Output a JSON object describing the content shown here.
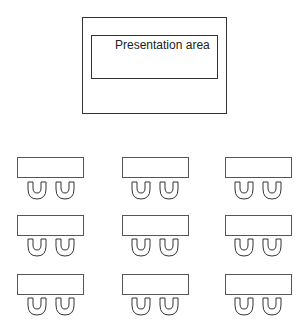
{
  "diagram": {
    "type": "classroom-seating-layout",
    "presentation": {
      "label": "Presentation area"
    },
    "colors": {
      "stroke": "#333333",
      "table_stroke": "#555555",
      "background": "#ffffff"
    },
    "grid": {
      "rows": 3,
      "columns": 3,
      "chairs_per_table": 2
    },
    "groups": [
      {
        "row": 1,
        "col": 1,
        "table": {
          "x": 17,
          "y": 157
        },
        "chairs": [
          {
            "x": 27,
            "y": 181
          },
          {
            "x": 55,
            "y": 181
          }
        ]
      },
      {
        "row": 1,
        "col": 2,
        "table": {
          "x": 122,
          "y": 157
        },
        "chairs": [
          {
            "x": 131,
            "y": 181
          },
          {
            "x": 159,
            "y": 181
          }
        ]
      },
      {
        "row": 1,
        "col": 3,
        "table": {
          "x": 225,
          "y": 157
        },
        "chairs": [
          {
            "x": 234,
            "y": 181
          },
          {
            "x": 262,
            "y": 181
          }
        ]
      },
      {
        "row": 2,
        "col": 1,
        "table": {
          "x": 17,
          "y": 215
        },
        "chairs": [
          {
            "x": 27,
            "y": 238
          },
          {
            "x": 55,
            "y": 238
          }
        ]
      },
      {
        "row": 2,
        "col": 2,
        "table": {
          "x": 122,
          "y": 215
        },
        "chairs": [
          {
            "x": 131,
            "y": 238
          },
          {
            "x": 159,
            "y": 238
          }
        ]
      },
      {
        "row": 2,
        "col": 3,
        "table": {
          "x": 225,
          "y": 215
        },
        "chairs": [
          {
            "x": 234,
            "y": 238
          },
          {
            "x": 262,
            "y": 238
          }
        ]
      },
      {
        "row": 3,
        "col": 1,
        "table": {
          "x": 17,
          "y": 274
        },
        "chairs": [
          {
            "x": 27,
            "y": 297
          },
          {
            "x": 55,
            "y": 297
          }
        ]
      },
      {
        "row": 3,
        "col": 2,
        "table": {
          "x": 122,
          "y": 274
        },
        "chairs": [
          {
            "x": 131,
            "y": 297
          },
          {
            "x": 159,
            "y": 297
          }
        ]
      },
      {
        "row": 3,
        "col": 3,
        "table": {
          "x": 225,
          "y": 274
        },
        "chairs": [
          {
            "x": 234,
            "y": 297
          },
          {
            "x": 262,
            "y": 297
          }
        ]
      }
    ]
  }
}
